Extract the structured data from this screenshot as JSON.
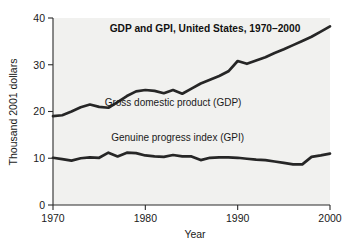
{
  "chart_data": {
    "type": "line",
    "title": "GDP and GPI, United States, 1970–2000",
    "xlabel": "Year",
    "ylabel": "Thousand 2001 dollars",
    "xlim": [
      1970,
      2000
    ],
    "ylim": [
      0,
      40
    ],
    "grid": false,
    "legend_position": "inline-labels",
    "xticks": [
      "1970",
      "1980",
      "1990",
      "2000"
    ],
    "xtick_values": [
      1970,
      1980,
      1990,
      2000
    ],
    "yticks": [
      "0",
      "10",
      "20",
      "30",
      "40"
    ],
    "ytick_values": [
      0,
      10,
      20,
      30,
      40
    ],
    "x": [
      1970,
      1971,
      1972,
      1973,
      1974,
      1975,
      1976,
      1977,
      1978,
      1979,
      1980,
      1981,
      1982,
      1983,
      1984,
      1985,
      1986,
      1987,
      1988,
      1989,
      1990,
      1991,
      1992,
      1993,
      1994,
      1995,
      1996,
      1997,
      1998,
      1999,
      2000
    ],
    "series": [
      {
        "name": "Gross domestic product (GDP)",
        "label": "Gross domestic product (GDP)",
        "color": "#262626",
        "label_x": 1983.0,
        "label_y": 21.2,
        "values": [
          19.0,
          19.2,
          20.0,
          20.9,
          21.5,
          21.0,
          20.8,
          22.0,
          23.3,
          24.3,
          24.6,
          24.4,
          23.9,
          24.6,
          23.8,
          24.9,
          26.0,
          26.8,
          27.6,
          28.6,
          30.8,
          30.2,
          30.9,
          31.6,
          32.5,
          33.3,
          34.2,
          35.1,
          36.0,
          37.1,
          38.2
        ]
      },
      {
        "name": "Genuine progress index (GPI)",
        "label": "Genuine progress index (GPI)",
        "color": "#262626",
        "label_x": 1983.5,
        "label_y": 13.7,
        "values": [
          10.1,
          9.8,
          9.5,
          10.0,
          10.2,
          10.1,
          11.2,
          10.4,
          11.2,
          11.1,
          10.6,
          10.4,
          10.3,
          10.7,
          10.4,
          10.4,
          9.6,
          10.1,
          10.2,
          10.2,
          10.1,
          9.9,
          9.7,
          9.6,
          9.3,
          9.0,
          8.7,
          9.3,
          9.9,
          8.9,
          9.3
        ]
      }
    ],
    "gpi_tail": {
      "note": "GPI rises at end",
      "x": [
        1997,
        1998,
        1999,
        2000
      ],
      "values": [
        8.7,
        10.3,
        10.6,
        11.0
      ]
    }
  }
}
